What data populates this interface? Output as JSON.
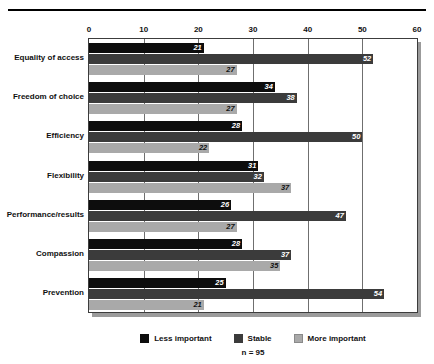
{
  "chart_data": {
    "type": "bar",
    "orientation": "horizontal",
    "title": "",
    "xlabel": "",
    "ylabel": "",
    "xlim": [
      0,
      60
    ],
    "xticks": [
      0,
      10,
      20,
      30,
      40,
      50,
      60
    ],
    "grid": true,
    "legend_position": "bottom",
    "footnote": "n = 95",
    "categories": [
      "Equality of access",
      "Freedom of choice",
      "Efficiency",
      "Flexibility",
      "Performance/results",
      "Compassion",
      "Prevention"
    ],
    "series": [
      {
        "name": "Less important",
        "color": "#0d0d0d",
        "values": [
          21,
          34,
          28,
          31,
          26,
          28,
          25
        ]
      },
      {
        "name": "Stable",
        "color": "#3b3b3b",
        "values": [
          52,
          38,
          50,
          32,
          47,
          37,
          54
        ]
      },
      {
        "name": "More important",
        "color": "#a9a9a9",
        "values": [
          27,
          27,
          22,
          37,
          27,
          35,
          21
        ]
      }
    ]
  },
  "legend": {
    "items": [
      {
        "label": "Less important"
      },
      {
        "label": "Stable"
      },
      {
        "label": "More important"
      }
    ]
  },
  "footnote": {
    "text": "n = 95"
  }
}
